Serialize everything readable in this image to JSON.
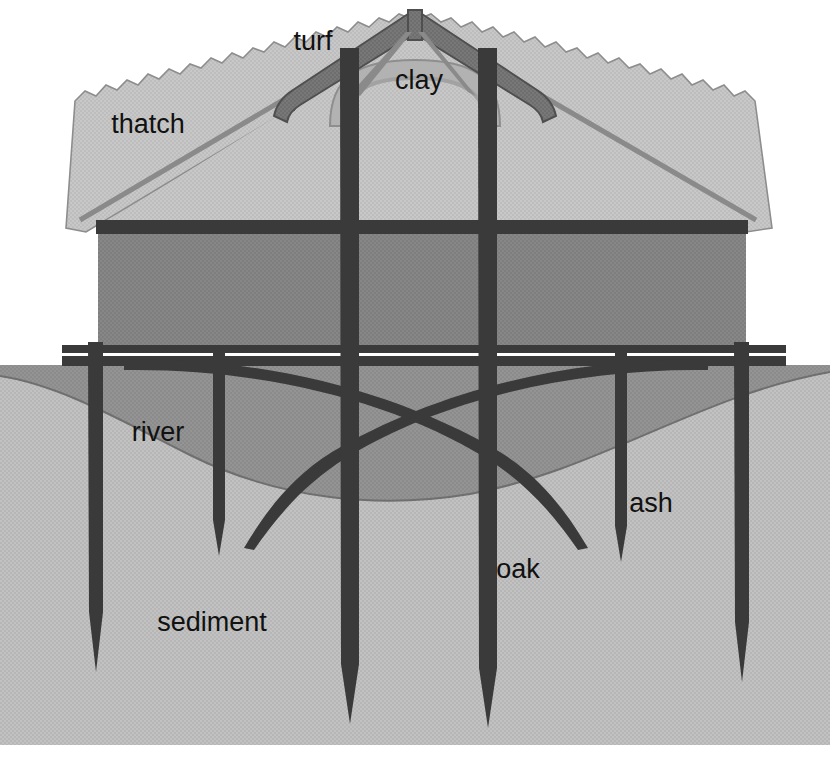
{
  "diagram": {
    "type": "architectural-cross-section",
    "width": 830,
    "height": 762,
    "background_color": "#ffffff"
  },
  "labels": [
    {
      "id": "turf",
      "text": "turf",
      "x": 313,
      "y": 50,
      "anchor": "middle",
      "refers_to": "roof-ridge-capping"
    },
    {
      "id": "clay",
      "text": "clay",
      "x": 419,
      "y": 89,
      "anchor": "middle",
      "refers_to": "clay-arch-under-ridge"
    },
    {
      "id": "thatch",
      "text": "thatch",
      "x": 148,
      "y": 133,
      "anchor": "middle",
      "refers_to": "roof-thatch-surface"
    },
    {
      "id": "river",
      "text": "river",
      "x": 158,
      "y": 441,
      "anchor": "middle",
      "refers_to": "river-water-body"
    },
    {
      "id": "ash",
      "text": "ash",
      "x": 651,
      "y": 512,
      "anchor": "middle",
      "refers_to": "ash-pile-short"
    },
    {
      "id": "oak",
      "text": "oak",
      "x": 518,
      "y": 578,
      "anchor": "middle",
      "refers_to": "oak-pile-long"
    },
    {
      "id": "sediment",
      "text": "sediment",
      "x": 212,
      "y": 631,
      "anchor": "middle",
      "refers_to": "sediment-bed"
    }
  ],
  "colors": {
    "background": "#ffffff",
    "thatch_fill": "#bdbdbd",
    "thatch_edge": "#9a9a9a",
    "turf_ridge": "#6e6e6e",
    "turf_ridge_edge": "#4f4f4f",
    "clay_arch": "#b2b2b2",
    "clay_outline": "#8e8e8e",
    "wall_fill": "#7e7e7e",
    "timber_dark": "#3a3a3a",
    "timber_outline": "#2b2b2b",
    "river_fill": "#8b8b8b",
    "sediment_fill": "#b6b6b6",
    "label_text": "#111111"
  },
  "structure": {
    "roof": {
      "name": "thatched gable roof",
      "apex_x": 415,
      "apex_y": 10,
      "left_eave_x": 66,
      "right_eave_x": 772,
      "eave_y": 228,
      "edge_style": "serrated thatch fringe",
      "ridge_cap_material": "turf"
    },
    "clay_arch": {
      "name": "clay arch beneath ridge",
      "span_left_x": 330,
      "span_right_x": 500,
      "crown_y": 70,
      "base_y": 122
    },
    "wall": {
      "name": "upper storey wall",
      "left_x": 98,
      "right_x": 746,
      "top_y": 222,
      "bottom_y": 348,
      "fill": "#7e7e7e"
    },
    "floor_beams": {
      "name": "floor plate beams",
      "left_x": 62,
      "right_x": 786,
      "top_y": 346,
      "bottom_y": 366,
      "count": 2,
      "description": "two thin parallel horizontal timber plates"
    },
    "wall_tie_beam": {
      "name": "upper tie beam",
      "left_x": 98,
      "right_x": 746,
      "y": 222,
      "thickness": 12
    },
    "water_line_y": 365,
    "sediment_surface": {
      "name": "sediment bed surface",
      "left_y": 375,
      "dip_center_x": 400,
      "dip_y": 497,
      "right_y": 372,
      "description": "scoured concave channel profile beneath the building"
    },
    "ground_top_y": 365,
    "ground_bottom_y": 745
  },
  "piles": [
    {
      "id": "pile-1",
      "material": "oak",
      "x": 95,
      "top_y": 346,
      "tip_y": 672,
      "width": 15,
      "label": null
    },
    {
      "id": "pile-2",
      "material": "ash",
      "x": 219,
      "top_y": 352,
      "tip_y": 556,
      "width": 13,
      "label": null
    },
    {
      "id": "pile-3",
      "material": "oak",
      "x": 349,
      "top_y": 48,
      "tip_y": 724,
      "width": 19,
      "label": null
    },
    {
      "id": "pile-4",
      "material": "oak",
      "x": 487,
      "top_y": 48,
      "tip_y": 728,
      "width": 19,
      "label": "oak"
    },
    {
      "id": "pile-5",
      "material": "ash",
      "x": 621,
      "top_y": 352,
      "tip_y": 562,
      "width": 13,
      "label": "ash"
    },
    {
      "id": "pile-6",
      "material": "oak",
      "x": 741,
      "top_y": 346,
      "tip_y": 682,
      "width": 15,
      "label": null
    }
  ],
  "braces": [
    {
      "id": "brace-left-to-right",
      "description": "curved raking brace from left floor plate down to the right",
      "from": [
        248,
        533
      ],
      "to": [
        700,
        360
      ]
    },
    {
      "id": "brace-right-to-left",
      "description": "curved raking brace from right floor plate down to the left",
      "from": [
        586,
        545
      ],
      "to": [
        130,
        360
      ]
    }
  ],
  "legend_items": [
    {
      "key": "turf",
      "meaning": "turf ridge capping over the roof apex"
    },
    {
      "key": "clay",
      "meaning": "clay arch supporting the ridge"
    },
    {
      "key": "thatch",
      "meaning": "thatched roof covering"
    },
    {
      "key": "river",
      "meaning": "river water surrounding the piles"
    },
    {
      "key": "sediment",
      "meaning": "river-bed sediment the piles are driven into"
    },
    {
      "key": "oak",
      "meaning": "oak piles (long, load-bearing)"
    },
    {
      "key": "ash",
      "meaning": "ash piles (shorter, secondary)"
    }
  ]
}
